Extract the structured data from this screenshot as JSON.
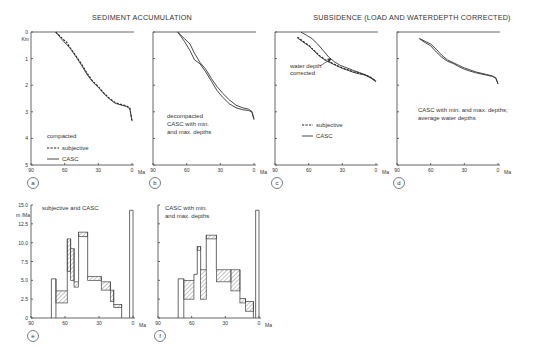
{
  "titles": {
    "left": "SEDIMENT ACCUMULATION",
    "right": "SUBSIDENCE (LOAD AND WATERDEPTH CORRECTED)"
  },
  "axis": {
    "x_unit": "Ma",
    "x_ticks": [
      "90",
      "60",
      "30",
      "0"
    ],
    "depth_unit": "Km",
    "depth_ticks": [
      "0",
      "1",
      "2",
      "3",
      "4",
      "5"
    ],
    "rate_unit": "m /Ma",
    "rate_ticks": [
      "0",
      "2.5",
      "5.0",
      "7.5",
      "10.0",
      "12.5",
      "15.0"
    ]
  },
  "panels": {
    "a": {
      "label": "a",
      "text1": "compacted",
      "legend_dashed": "subjective",
      "legend_solid": "CASC"
    },
    "b": {
      "label": "b",
      "text1": "decompacted",
      "text2": "CASC with min.",
      "text3": "and max. depths"
    },
    "c": {
      "label": "c",
      "annotation1": "water depth",
      "annotation2": "corrected",
      "legend_dashed": "subjective",
      "legend_solid": "CASC"
    },
    "d": {
      "label": "d",
      "text1": "CASC with min. and max. depths;",
      "text2": "average water depths"
    },
    "e": {
      "label": "e",
      "text1": "subjective and CASC"
    },
    "f": {
      "label": "f",
      "text1": "CASC with min.",
      "text2": "and max. depths"
    }
  },
  "chart_data": [
    {
      "panel": "a",
      "type": "line",
      "title": "SEDIMENT ACCUMULATION — compacted",
      "xlabel": "Ma",
      "ylabel": "Km",
      "xlim": [
        90,
        0
      ],
      "ylim": [
        0,
        5
      ],
      "y_inverted": true,
      "series": [
        {
          "name": "subjective",
          "style": "dashed",
          "x": [
            68,
            62,
            58,
            55,
            50,
            45,
            40,
            35,
            30,
            25,
            20,
            15,
            10,
            5,
            2,
            0
          ],
          "y": [
            0,
            0.25,
            0.4,
            0.6,
            0.9,
            1.2,
            1.55,
            1.85,
            2.05,
            2.3,
            2.5,
            2.65,
            2.72,
            2.78,
            2.85,
            3.35
          ]
        },
        {
          "name": "CASC",
          "style": "solid",
          "x": [
            68,
            62,
            58,
            55,
            50,
            45,
            40,
            35,
            30,
            25,
            20,
            15,
            10,
            5,
            2,
            0
          ],
          "y": [
            0,
            0.3,
            0.48,
            0.62,
            0.92,
            1.25,
            1.6,
            1.88,
            2.08,
            2.32,
            2.52,
            2.68,
            2.74,
            2.8,
            2.88,
            3.35
          ]
        }
      ]
    },
    {
      "panel": "b",
      "type": "line",
      "title": "SEDIMENT ACCUMULATION — decompacted CASC with min. and max. depths",
      "xlabel": "Ma",
      "ylabel": "Km",
      "xlim": [
        90,
        0
      ],
      "ylim": [
        0,
        5
      ],
      "y_inverted": true,
      "series": [
        {
          "name": "CASC min. depth",
          "style": "solid",
          "x": [
            68,
            62,
            57,
            53,
            48,
            43,
            38,
            33,
            28,
            22,
            16,
            10,
            5,
            2,
            0
          ],
          "y": [
            0,
            0.25,
            0.45,
            0.8,
            1.15,
            1.4,
            1.75,
            2.05,
            2.3,
            2.55,
            2.75,
            2.85,
            2.9,
            2.98,
            3.25
          ]
        },
        {
          "name": "CASC max. depth",
          "style": "solid",
          "x": [
            68,
            62,
            57,
            53,
            48,
            43,
            38,
            33,
            28,
            22,
            16,
            10,
            5,
            2,
            0
          ],
          "y": [
            0,
            0.35,
            0.7,
            1.05,
            1.2,
            1.5,
            1.85,
            2.2,
            2.45,
            2.7,
            2.85,
            2.92,
            2.95,
            3.0,
            3.3
          ]
        }
      ]
    },
    {
      "panel": "c",
      "type": "line",
      "title": "SUBSIDENCE — water depth corrected",
      "xlabel": "Ma",
      "ylabel": "Km",
      "xlim": [
        90,
        0
      ],
      "ylim": [
        0,
        5
      ],
      "y_inverted": true,
      "series": [
        {
          "name": "subjective",
          "style": "dashed",
          "x": [
            70,
            65,
            60,
            55,
            50,
            45,
            40,
            35,
            30,
            25,
            20,
            15,
            10,
            5,
            0
          ],
          "y": [
            0.2,
            0.35,
            0.5,
            0.7,
            0.9,
            1.05,
            1.15,
            1.25,
            1.35,
            1.42,
            1.5,
            1.55,
            1.6,
            1.7,
            1.85
          ]
        },
        {
          "name": "CASC (water depth corrected)",
          "style": "solid",
          "x": [
            70,
            65,
            60,
            55,
            50,
            45,
            40,
            35,
            30,
            25,
            20,
            15,
            10,
            5,
            0
          ],
          "y": [
            0.22,
            0.38,
            0.52,
            0.72,
            0.92,
            1.07,
            1.17,
            1.27,
            1.37,
            1.44,
            1.52,
            1.57,
            1.62,
            1.72,
            1.87
          ]
        },
        {
          "name": "CASC (uncorrected)",
          "style": "solid",
          "x": [
            67,
            62,
            57,
            52,
            47,
            42,
            37,
            32,
            27,
            20,
            15,
            10,
            5,
            0
          ],
          "y": [
            0,
            0.12,
            0.25,
            0.45,
            0.7,
            0.95,
            1.12,
            1.25,
            1.33,
            1.45,
            1.52,
            1.6,
            1.7,
            1.85
          ]
        }
      ]
    },
    {
      "panel": "d",
      "type": "line",
      "title": "SUBSIDENCE — CASC with min. and max. depths; average water depths",
      "xlabel": "Ma",
      "ylabel": "Km",
      "xlim": [
        90,
        0
      ],
      "ylim": [
        0,
        5
      ],
      "y_inverted": true,
      "series": [
        {
          "name": "min. depth",
          "style": "solid",
          "x": [
            70,
            65,
            60,
            55,
            50,
            45,
            40,
            35,
            30,
            25,
            20,
            15,
            10,
            5,
            2,
            0
          ],
          "y": [
            0.25,
            0.35,
            0.45,
            0.65,
            0.88,
            1.05,
            1.15,
            1.25,
            1.35,
            1.42,
            1.5,
            1.55,
            1.6,
            1.65,
            1.72,
            1.95
          ]
        },
        {
          "name": "max. depth",
          "style": "solid",
          "x": [
            70,
            65,
            60,
            55,
            50,
            45,
            40,
            35,
            30,
            25,
            20,
            15,
            10,
            5,
            2,
            0
          ],
          "y": [
            0.25,
            0.4,
            0.52,
            0.75,
            0.95,
            1.1,
            1.18,
            1.3,
            1.4,
            1.47,
            1.53,
            1.58,
            1.62,
            1.67,
            1.74,
            1.95
          ]
        }
      ]
    },
    {
      "panel": "e",
      "type": "bar",
      "title": "subjective and CASC",
      "xlabel": "Ma",
      "ylabel": "m /Ma",
      "xlim": [
        90,
        0
      ],
      "ylim": [
        0,
        15
      ],
      "bars": [
        {
          "from": 72,
          "to": 68,
          "low": 5.2,
          "high": 5.2
        },
        {
          "from": 68,
          "to": 58,
          "low": 2.0,
          "high": 3.6
        },
        {
          "from": 58,
          "to": 55,
          "low": 6.2,
          "high": 10.5
        },
        {
          "from": 55,
          "to": 52,
          "low": 5.0,
          "high": 9.2
        },
        {
          "from": 52,
          "to": 48,
          "low": 4.1,
          "high": 4.8
        },
        {
          "from": 48,
          "to": 40,
          "low": 10.8,
          "high": 11.4
        },
        {
          "from": 40,
          "to": 28,
          "low": 5.0,
          "high": 5.5
        },
        {
          "from": 28,
          "to": 20,
          "low": 3.7,
          "high": 4.8
        },
        {
          "from": 20,
          "to": 17,
          "low": 2.2,
          "high": 3.7
        },
        {
          "from": 17,
          "to": 10,
          "low": 1.4,
          "high": 1.8
        },
        {
          "from": 3,
          "to": 0,
          "low": 14.3,
          "high": 14.3
        }
      ]
    },
    {
      "panel": "f",
      "type": "bar",
      "title": "CASC with min. and max. depths",
      "xlabel": "Ma",
      "ylabel": "m /Ma",
      "xlim": [
        90,
        0
      ],
      "ylim": [
        0,
        15
      ],
      "bars": [
        {
          "from": 72,
          "to": 67,
          "low": 5.2,
          "high": 5.2
        },
        {
          "from": 67,
          "to": 58,
          "low": 2.5,
          "high": 5.0
        },
        {
          "from": 58,
          "to": 55,
          "low": 5.8,
          "high": 5.8
        },
        {
          "from": 55,
          "to": 52,
          "low": 9.0,
          "high": 9.5
        },
        {
          "from": 52,
          "to": 47,
          "low": 2.5,
          "high": 6.4
        },
        {
          "from": 47,
          "to": 38,
          "low": 10.5,
          "high": 11.0
        },
        {
          "from": 38,
          "to": 25,
          "low": 4.8,
          "high": 6.4
        },
        {
          "from": 25,
          "to": 17,
          "low": 3.6,
          "high": 6.4
        },
        {
          "from": 17,
          "to": 12,
          "low": 2.0,
          "high": 2.6
        },
        {
          "from": 12,
          "to": 5,
          "low": 0.9,
          "high": 2.2
        },
        {
          "from": 3,
          "to": 0,
          "low": 14.3,
          "high": 14.3
        }
      ]
    }
  ]
}
